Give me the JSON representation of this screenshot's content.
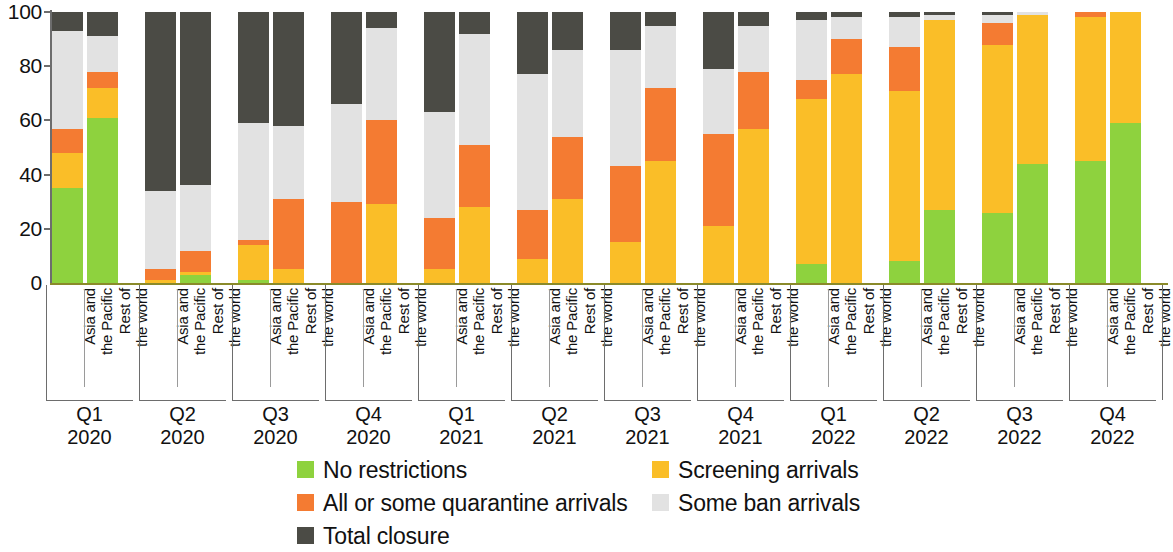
{
  "chart_data": {
    "type": "bar",
    "subtype": "stacked-percentage",
    "title": "",
    "xlabel": "",
    "ylabel": "",
    "ylim": [
      0,
      100
    ],
    "yticks": [
      0,
      20,
      40,
      60,
      80,
      100
    ],
    "ytick_labels": [
      "0",
      "20",
      "40",
      "60",
      "80",
      "100"
    ],
    "grid": false,
    "legend_position": "bottom",
    "stack_order": [
      "No restrictions",
      "Screening arrivals",
      "All or some quarantine arrivals",
      "Some ban arrivals",
      "Total closure"
    ],
    "series": [
      {
        "name": "No restrictions",
        "color": "#8ed23e",
        "values": [
          35,
          61,
          0,
          3,
          1,
          0,
          0,
          0,
          0,
          0,
          0,
          0,
          0,
          0,
          0,
          0,
          7,
          0,
          8,
          27,
          26,
          44,
          45,
          59
        ]
      },
      {
        "name": "Screening arrivals",
        "color": "#fabe28",
        "values": [
          13,
          11,
          1,
          1,
          13,
          5,
          0,
          29,
          5,
          28,
          9,
          31,
          15,
          45,
          21,
          57,
          61,
          77,
          63,
          70,
          62,
          55,
          53,
          41
        ]
      },
      {
        "name": "All or some quarantine arrivals",
        "color": "#f47b32",
        "values": [
          9,
          6,
          4,
          8,
          2,
          26,
          30,
          31,
          19,
          23,
          18,
          23,
          28,
          27,
          34,
          21,
          7,
          13,
          16,
          0,
          8,
          0,
          2,
          0
        ]
      },
      {
        "name": "Some ban arrivals",
        "color": "#e2e2e2",
        "values": [
          36,
          13,
          29,
          24,
          43,
          27,
          36,
          34,
          39,
          41,
          50,
          32,
          43,
          23,
          24,
          17,
          22,
          8,
          11,
          2,
          3,
          1,
          0,
          0
        ]
      },
      {
        "name": "Total closure",
        "color": "#4b4b45",
        "values": [
          7,
          9,
          66,
          64,
          41,
          42,
          34,
          6,
          37,
          8,
          23,
          14,
          14,
          5,
          21,
          5,
          3,
          2,
          2,
          1,
          1,
          0,
          0,
          0
        ]
      }
    ],
    "categories": [
      "Asia and\nthe Pacific",
      "Rest of\nthe world",
      "Asia and\nthe Pacific",
      "Rest of\nthe world",
      "Asia and\nthe Pacific",
      "Rest of\nthe world",
      "Asia and\nthe Pacific",
      "Rest of\nthe world",
      "Asia and\nthe Pacific",
      "Rest of\nthe world",
      "Asia and\nthe Pacific",
      "Rest of\nthe world",
      "Asia and\nthe Pacific",
      "Rest of\nthe world",
      "Asia and\nthe Pacific",
      "Rest of\nthe world",
      "Asia and\nthe Pacific",
      "Rest of\nthe world",
      "Asia and\nthe Pacific",
      "Rest of\nthe world",
      "Asia and\nthe Pacific",
      "Rest of\nthe world",
      "Asia and\nthe Pacific",
      "Rest of\nthe world"
    ],
    "groups": [
      "Q1\n2020",
      "Q2\n2020",
      "Q3\n2020",
      "Q4\n2020",
      "Q1\n2021",
      "Q2\n2021",
      "Q3\n2021",
      "Q4\n2021",
      "Q1\n2022",
      "Q2\n2022",
      "Q3\n2022",
      "Q4\n2022"
    ],
    "legend": [
      {
        "label": "No restrictions",
        "color": "#8ed23e"
      },
      {
        "label": "Screening arrivals",
        "color": "#fabe28"
      },
      {
        "label": "All or some quarantine arrivals",
        "color": "#f47b32"
      },
      {
        "label": "Some ban arrivals",
        "color": "#e2e2e2"
      },
      {
        "label": "Total closure",
        "color": "#4b4b45"
      }
    ]
  }
}
